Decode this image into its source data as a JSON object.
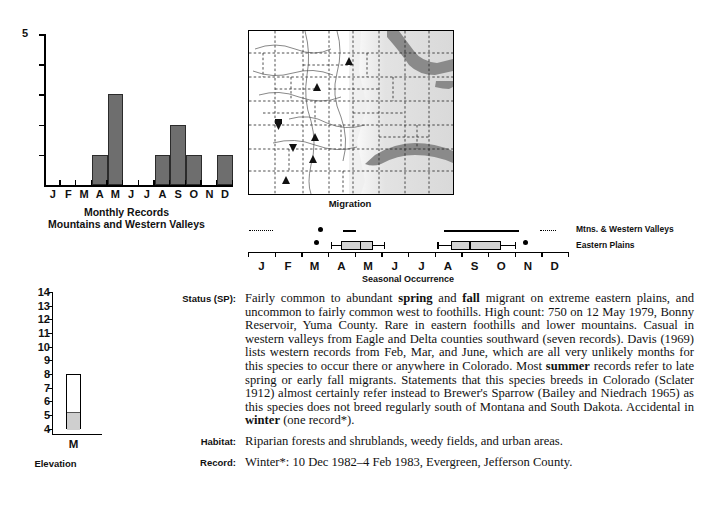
{
  "monthly_chart": {
    "caption_line1": "Monthly Records",
    "caption_line2": "Mountains and Western Valleys",
    "y_max_label": "5"
  },
  "map": {
    "caption": "Migration"
  },
  "seasonal": {
    "caption": "Seasonal Occurrence",
    "legend": [
      {
        "label": "Mtns. & Western Valleys"
      },
      {
        "label": "Eastern Plains"
      }
    ]
  },
  "elevation": {
    "caption": "Elevation",
    "x_label": "M"
  },
  "entries": [
    {
      "label": "Status (SP):",
      "name": "status",
      "html": "Fairly common to abundant <b>spring</b> and <b>fall</b> migrant on extreme eastern plains, and uncommon to fairly common west to foothills. High count: 750 on 12 May 1979, Bonny Reservoir, Yuma County. Rare in eastern foothills and lower mountains. Casual in western valleys from Eagle and Delta counties southward (seven records). Davis (1969) lists western records from Feb, Mar, and June, which are all very unlikely months for this species to occur there or anywhere in Colorado. Most <b>summer</b> records refer to late spring or early fall migrants. Statements that this species breeds in Colorado (Sclater 1912) almost certainly refer instead to Brewer's Sparrow (Bailey and Niedrach 1965) as this species does not breed regularly south of Montana and South Dakota. Accidental in <b>winter</b> (one record*)."
    },
    {
      "label": "Habitat:",
      "name": "habitat",
      "html": "Riparian forests and shrublands, weedy fields, and urban areas."
    },
    {
      "label": "Record:",
      "name": "record",
      "html": "Winter*: 10 Dec 1982–4 Feb 1983, Evergreen, Jefferson County."
    }
  ],
  "chart_data": [
    {
      "type": "bar",
      "id": "monthly-records",
      "title": "Monthly Records",
      "subtitle": "Mountains and Western Valleys",
      "xlabel": "",
      "ylabel": "",
      "categories": [
        "J",
        "F",
        "M",
        "A",
        "M",
        "J",
        "J",
        "A",
        "S",
        "O",
        "N",
        "D"
      ],
      "values": [
        0,
        0,
        0,
        1,
        3,
        0,
        0,
        1,
        2,
        1,
        0,
        1
      ],
      "ylim": [
        0,
        5
      ],
      "yticks": [
        0,
        1,
        2,
        3,
        4,
        5
      ],
      "ytick_labels_shown": [
        "5"
      ],
      "grid": false,
      "legend": "none",
      "bar_color": "#6e6e6e"
    },
    {
      "type": "bar",
      "id": "elevation",
      "title": "Elevation",
      "xlabel": "M",
      "ylabel": "",
      "categories": [
        "M"
      ],
      "ylim": [
        3.6,
        14
      ],
      "yticks": [
        4,
        5,
        6,
        7,
        8,
        9,
        10,
        11,
        12,
        13,
        14
      ],
      "bar_bottom": 4,
      "bar_top": 8,
      "shaded_top": 5.3,
      "shaded_color": "#cfcfcf",
      "unit_note": "thousands of feet",
      "grid": false,
      "legend": "none"
    },
    {
      "type": "boxplot",
      "id": "seasonal-occurrence",
      "title": "Seasonal Occurrence",
      "xlabel": "",
      "categories": [
        "J",
        "F",
        "M",
        "A",
        "M",
        "J",
        "J",
        "A",
        "S",
        "O",
        "N",
        "D"
      ],
      "xlim": [
        0,
        12
      ],
      "series": [
        {
          "name": "Mtns. & Western Valleys",
          "style": "dotted-and-solid",
          "dotted_segments": [
            [
              0.05,
              0.95
            ],
            [
              10.95,
              11.55
            ]
          ],
          "solid_segments": [
            [
              3.55,
              4.05
            ],
            [
              7.35,
              10.15
            ]
          ],
          "points": [
            2.7
          ]
        },
        {
          "name": "Eastern Plains",
          "style": "box",
          "points": [
            2.55,
            10.4
          ],
          "boxes": [
            {
              "whisker_low": 3.1,
              "box_low": 3.5,
              "median": 4.2,
              "box_high": 4.7,
              "whisker_high": 5.1
            },
            {
              "whisker_low": 7.1,
              "box_low": 7.6,
              "median": 8.3,
              "box_high": 9.5,
              "whisker_high": 10.0
            }
          ]
        }
      ],
      "grid": false
    }
  ]
}
